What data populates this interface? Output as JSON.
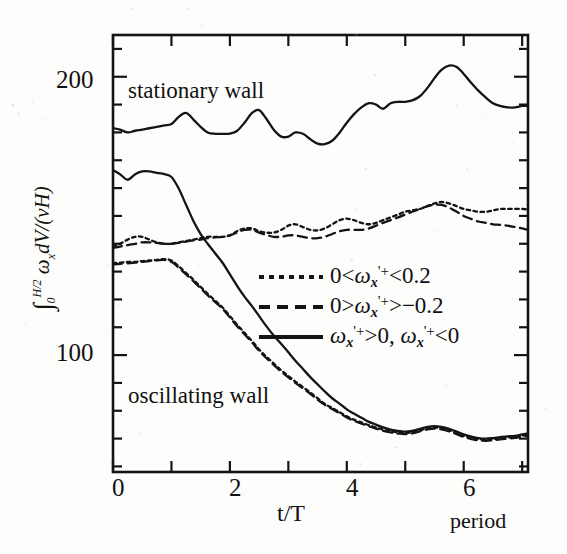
{
  "chart_data": {
    "type": "line",
    "title": "",
    "xlabel": "t/T",
    "ylabel": "∫0^(H/2) ωx dV/(νH)",
    "xlim": [
      0,
      7.1
    ],
    "ylim": [
      58,
      215
    ],
    "grid": false,
    "legend_position": "center-right",
    "x_ticks_major": [
      0,
      2,
      4,
      6
    ],
    "x_tick_labels": [
      "0",
      "2",
      "4",
      "6"
    ],
    "x_tick_step_minor": 1,
    "y_ticks_major": [
      100,
      200
    ],
    "y_tick_labels": [
      "100",
      "200"
    ],
    "y_tick_step_minor": 10,
    "annotations": [
      {
        "text": "stationary wall",
        "x": 0.35,
        "y": 193
      },
      {
        "text": "oscillating wall",
        "x": 0.35,
        "y": 81
      },
      {
        "text": "period",
        "x": 6.6,
        "y": 50
      }
    ],
    "series": [
      {
        "name": "stationary wall — ωx'+>0, ωx'+<0",
        "group": "stationary wall",
        "style": "solid",
        "x": [
          0.0,
          0.12,
          0.25,
          0.38,
          0.5,
          0.62,
          0.75,
          0.88,
          1.0,
          1.12,
          1.25,
          1.38,
          1.5,
          1.62,
          1.75,
          1.88,
          2.0,
          2.12,
          2.25,
          2.38,
          2.5,
          2.62,
          2.75,
          2.88,
          3.0,
          3.12,
          3.25,
          3.38,
          3.5,
          3.62,
          3.75,
          3.88,
          4.0,
          4.12,
          4.25,
          4.38,
          4.5,
          4.62,
          4.75,
          4.88,
          5.0,
          5.12,
          5.25,
          5.38,
          5.5,
          5.62,
          5.75,
          5.88,
          6.0,
          6.12,
          6.25,
          6.38,
          6.5,
          6.62,
          6.75,
          6.88,
          7.0,
          7.1
        ],
        "y": [
          181.5,
          181.0,
          180.0,
          180.6,
          181.0,
          181.5,
          182.0,
          182.5,
          183.0,
          185.5,
          187.0,
          184.5,
          182.0,
          180.0,
          179.5,
          179.5,
          179.6,
          180.5,
          183.5,
          187.0,
          188.0,
          185.0,
          181.0,
          178.5,
          178.5,
          180.0,
          179.5,
          177.5,
          176.0,
          175.8,
          177.0,
          180.0,
          183.5,
          186.5,
          189.0,
          190.5,
          190.0,
          188.5,
          190.5,
          191.0,
          191.0,
          191.5,
          193.0,
          196.0,
          199.5,
          202.5,
          204.0,
          203.5,
          201.0,
          198.0,
          195.0,
          192.5,
          190.5,
          189.5,
          189.0,
          189.0,
          189.5,
          189.5
        ]
      },
      {
        "name": "stationary wall — 0<ωx'+<0.2",
        "group": "stationary wall",
        "style": "dotted",
        "x": [
          0.0,
          0.12,
          0.25,
          0.38,
          0.5,
          0.62,
          0.75,
          0.88,
          1.0,
          1.12,
          1.25,
          1.38,
          1.5,
          1.62,
          1.75,
          1.88,
          2.0,
          2.12,
          2.25,
          2.38,
          2.5,
          2.62,
          2.75,
          2.88,
          3.0,
          3.12,
          3.25,
          3.38,
          3.5,
          3.62,
          3.75,
          3.88,
          4.0,
          4.12,
          4.25,
          4.38,
          4.5,
          4.62,
          4.75,
          4.88,
          5.0,
          5.12,
          5.25,
          5.38,
          5.5,
          5.62,
          5.75,
          5.88,
          6.0,
          6.12,
          6.25,
          6.38,
          6.5,
          6.62,
          6.75,
          6.88,
          7.0,
          7.1
        ],
        "y": [
          139.0,
          140.0,
          141.5,
          142.5,
          142.5,
          141.5,
          140.5,
          140.0,
          140.0,
          140.5,
          141.0,
          141.5,
          142.0,
          142.5,
          142.5,
          142.5,
          143.0,
          144.5,
          145.5,
          145.5,
          144.5,
          144.0,
          144.0,
          145.0,
          146.5,
          147.0,
          146.0,
          145.0,
          144.8,
          145.5,
          147.0,
          148.5,
          149.0,
          148.5,
          147.5,
          147.0,
          147.5,
          148.5,
          149.5,
          150.5,
          151.5,
          152.0,
          152.5,
          153.5,
          154.5,
          155.0,
          154.5,
          153.5,
          152.5,
          152.0,
          151.5,
          151.5,
          152.0,
          152.5,
          152.5,
          152.5,
          152.5,
          152.3
        ]
      },
      {
        "name": "stationary wall — 0>ωx'+>-0.2",
        "group": "stationary wall",
        "style": "dashed",
        "x": [
          0.0,
          0.12,
          0.25,
          0.38,
          0.5,
          0.62,
          0.75,
          0.88,
          1.0,
          1.12,
          1.25,
          1.38,
          1.5,
          1.62,
          1.75,
          1.88,
          2.0,
          2.12,
          2.25,
          2.38,
          2.5,
          2.62,
          2.75,
          2.88,
          3.0,
          3.12,
          3.25,
          3.38,
          3.5,
          3.62,
          3.75,
          3.88,
          4.0,
          4.12,
          4.25,
          4.38,
          4.5,
          4.62,
          4.75,
          4.88,
          5.0,
          5.12,
          5.25,
          5.38,
          5.5,
          5.62,
          5.75,
          5.88,
          6.0,
          6.12,
          6.25,
          6.38,
          6.5,
          6.62,
          6.75,
          6.88,
          7.0,
          7.1
        ],
        "y": [
          138.5,
          139.0,
          139.5,
          140.0,
          140.5,
          140.5,
          140.3,
          140.0,
          140.0,
          140.3,
          140.8,
          141.2,
          141.5,
          142.0,
          142.3,
          142.5,
          143.0,
          144.0,
          145.0,
          145.0,
          144.0,
          143.2,
          142.5,
          142.5,
          143.0,
          143.0,
          142.5,
          142.0,
          142.0,
          142.5,
          143.5,
          144.5,
          145.0,
          145.0,
          145.0,
          145.5,
          146.5,
          147.5,
          148.5,
          149.5,
          150.5,
          151.5,
          152.5,
          153.5,
          154.0,
          154.0,
          153.0,
          151.5,
          150.0,
          149.0,
          148.0,
          147.5,
          147.0,
          146.8,
          146.5,
          146.0,
          145.5,
          145.0
        ]
      },
      {
        "name": "oscillating wall — ωx'+>0, ωx'+<0",
        "group": "oscillating wall",
        "style": "solid",
        "x": [
          0.0,
          0.12,
          0.25,
          0.38,
          0.5,
          0.62,
          0.75,
          0.88,
          1.0,
          1.12,
          1.25,
          1.38,
          1.5,
          1.62,
          1.75,
          1.88,
          2.0,
          2.12,
          2.25,
          2.38,
          2.5,
          2.62,
          2.75,
          2.88,
          3.0,
          3.12,
          3.25,
          3.38,
          3.5,
          3.62,
          3.75,
          3.88,
          4.0,
          4.12,
          4.25,
          4.38,
          4.5,
          4.62,
          4.75,
          4.88,
          5.0,
          5.12,
          5.25,
          5.38,
          5.5,
          5.62,
          5.75,
          5.88,
          6.0,
          6.12,
          6.25,
          6.38,
          6.5,
          6.62,
          6.75,
          6.88,
          7.0,
          7.1
        ],
        "y": [
          166.5,
          165.0,
          163.0,
          165.0,
          166.0,
          166.0,
          165.5,
          165.0,
          164.0,
          160.0,
          154.0,
          148.0,
          143.5,
          140.0,
          136.5,
          133.0,
          129.0,
          125.0,
          121.0,
          117.5,
          114.0,
          110.5,
          107.0,
          104.0,
          101.0,
          98.0,
          95.0,
          92.0,
          89.5,
          87.0,
          84.5,
          82.5,
          80.5,
          79.0,
          77.5,
          76.0,
          75.0,
          74.0,
          73.2,
          72.8,
          72.5,
          72.8,
          73.5,
          74.2,
          74.5,
          74.2,
          73.5,
          72.5,
          71.5,
          70.8,
          70.2,
          70.0,
          70.2,
          70.5,
          70.8,
          71.0,
          71.5,
          71.8
        ]
      },
      {
        "name": "oscillating wall — 0<ωx'+<0.2",
        "group": "oscillating wall",
        "style": "dotted",
        "x": [
          0.0,
          0.12,
          0.25,
          0.38,
          0.5,
          0.62,
          0.75,
          0.88,
          1.0,
          1.12,
          1.25,
          1.38,
          1.5,
          1.62,
          1.75,
          1.88,
          2.0,
          2.12,
          2.25,
          2.38,
          2.5,
          2.62,
          2.75,
          2.88,
          3.0,
          3.12,
          3.25,
          3.38,
          3.5,
          3.62,
          3.75,
          3.88,
          4.0,
          4.12,
          4.25,
          4.38,
          4.5,
          4.62,
          4.75,
          4.88,
          5.0,
          5.12,
          5.25,
          5.38,
          5.5,
          5.62,
          5.75,
          5.88,
          6.0,
          6.12,
          6.25,
          6.38,
          6.5,
          6.62,
          6.75,
          6.88,
          7.0,
          7.1
        ],
        "y": [
          133.0,
          133.2,
          133.5,
          133.5,
          133.8,
          134.0,
          134.2,
          134.5,
          134.0,
          132.0,
          129.5,
          127.0,
          124.5,
          122.0,
          119.5,
          117.0,
          114.0,
          111.0,
          108.0,
          105.0,
          102.0,
          99.5,
          97.0,
          94.5,
          92.5,
          90.5,
          88.5,
          86.5,
          84.5,
          82.5,
          81.0,
          79.5,
          78.0,
          76.8,
          75.8,
          74.8,
          74.0,
          73.2,
          72.6,
          72.2,
          72.0,
          72.3,
          73.0,
          73.7,
          74.0,
          73.7,
          73.0,
          72.0,
          71.0,
          70.3,
          69.8,
          69.6,
          69.8,
          70.1,
          70.4,
          70.7,
          71.1,
          71.4
        ]
      },
      {
        "name": "oscillating wall — 0>ωx'+>-0.2",
        "group": "oscillating wall",
        "style": "dashed",
        "x": [
          0.0,
          0.12,
          0.25,
          0.38,
          0.5,
          0.62,
          0.75,
          0.88,
          1.0,
          1.12,
          1.25,
          1.38,
          1.5,
          1.62,
          1.75,
          1.88,
          2.0,
          2.12,
          2.25,
          2.38,
          2.5,
          2.62,
          2.75,
          2.88,
          3.0,
          3.12,
          3.25,
          3.38,
          3.5,
          3.62,
          3.75,
          3.88,
          4.0,
          4.12,
          4.25,
          4.38,
          4.5,
          4.62,
          4.75,
          4.88,
          5.0,
          5.12,
          5.25,
          5.38,
          5.5,
          5.62,
          5.75,
          5.88,
          6.0,
          6.12,
          6.25,
          6.38,
          6.5,
          6.62,
          6.75,
          6.88,
          7.0,
          7.1
        ],
        "y": [
          132.5,
          132.8,
          133.0,
          133.2,
          133.5,
          133.8,
          134.0,
          134.2,
          133.5,
          131.5,
          129.0,
          126.5,
          124.0,
          121.5,
          119.0,
          116.5,
          113.5,
          110.5,
          107.5,
          104.5,
          101.5,
          99.0,
          96.5,
          94.0,
          92.0,
          90.0,
          88.0,
          86.0,
          84.0,
          82.2,
          80.6,
          79.1,
          77.6,
          76.4,
          75.4,
          74.4,
          73.6,
          72.8,
          72.2,
          71.8,
          71.6,
          71.9,
          72.6,
          73.3,
          73.6,
          73.3,
          72.6,
          71.6,
          70.6,
          69.9,
          69.4,
          69.2,
          69.4,
          69.7,
          70.0,
          70.3,
          70.7,
          71.0
        ]
      }
    ],
    "legend_entries": [
      {
        "style": "dotted",
        "label": "0<ωx'+<0.2"
      },
      {
        "style": "dashed",
        "label": "0>ωx'+>-0.2"
      },
      {
        "style": "solid",
        "label": "ωx'+>0, ωx'+<0"
      }
    ]
  },
  "axis": {
    "y_label_200": "200",
    "y_label_100": "100",
    "x_label_0": "0",
    "x_label_2": "2",
    "x_label_4": "4",
    "x_label_6": "6",
    "x_title": "t/T",
    "x_unit_note": "period"
  },
  "annotations": {
    "stationary_wall": "stationary wall",
    "oscillating_wall": "oscillating wall"
  },
  "legend": {
    "row1": {
      "prefix": "0<",
      "omega": "ω",
      "sub": "x",
      "sup": "'+",
      "suffix": "<0.2"
    },
    "row2": {
      "prefix": "0>",
      "omega": "ω",
      "sub": "x",
      "sup": "'+",
      "suffix": ">−0.2"
    },
    "row3": {
      "omega": "ω",
      "sub": "x",
      "sup": "'+",
      "mid": ">0, ",
      "omega2": "ω",
      "sub2": "x",
      "sup2": "'+",
      "suffix": "<0"
    }
  },
  "colors": {
    "ink": "#141414",
    "paper": "#fdfdfb",
    "grain": "#c9c7c2"
  }
}
